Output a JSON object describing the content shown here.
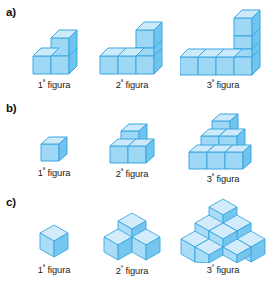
{
  "colors": {
    "cube_front": "#9ed8f5",
    "cube_top": "#cdeafb",
    "cube_side": "#6ec4ee",
    "cube_stroke": "#3ba7e0",
    "iso_top": "#d3ecfc",
    "iso_left": "#a9dcf7",
    "iso_right": "#74c6ef",
    "iso_stroke": "#3ba7e0",
    "text": "#1b1b1b",
    "background": "#ffffff"
  },
  "sections": [
    {
      "letter": "a)",
      "name": "section-a",
      "projection": "oblique",
      "figures": [
        {
          "label_number": "1",
          "label_ordinal": "ª",
          "label_word": "figura",
          "label_full": "1ª figura",
          "cube_count": 3,
          "description": "L-shape: 2 cubes in a row with 1 cube stacked on the right",
          "cells": [
            [
              0,
              0
            ],
            [
              1,
              0
            ],
            [
              1,
              1
            ]
          ]
        },
        {
          "label_number": "2",
          "label_ordinal": "ª",
          "label_word": "figura",
          "label_full": "2ª figura",
          "cube_count": 5,
          "description": "L-shape: 3 cubes in a row with 2 cubes stacked on the right",
          "cells": [
            [
              0,
              0
            ],
            [
              1,
              0
            ],
            [
              2,
              0
            ],
            [
              2,
              1
            ],
            [
              2,
              2
            ]
          ]
        },
        {
          "label_number": "3",
          "label_ordinal": "ª",
          "label_word": "figura",
          "label_full": "3ª figura",
          "cube_count": 7,
          "description": "L-shape: 4 cubes in a row with 3 cubes stacked on the right",
          "cells": [
            [
              0,
              0
            ],
            [
              1,
              0
            ],
            [
              2,
              0
            ],
            [
              3,
              0
            ],
            [
              3,
              1
            ],
            [
              3,
              2
            ],
            [
              3,
              3
            ]
          ]
        }
      ]
    },
    {
      "letter": "b)",
      "name": "section-b",
      "projection": "oblique",
      "figures": [
        {
          "label_number": "1",
          "label_ordinal": "ª",
          "label_word": "figura",
          "label_full": "1ª figura",
          "cube_count": 1,
          "description": "single cube",
          "rows": [
            1
          ]
        },
        {
          "label_number": "2",
          "label_ordinal": "ª",
          "label_word": "figura",
          "label_full": "2ª figura",
          "cube_count": 3,
          "description": "pyramid: 2 cubes base, 1 cube on top",
          "rows": [
            2,
            1
          ]
        },
        {
          "label_number": "3",
          "label_ordinal": "ª",
          "label_word": "figura",
          "label_full": "3ª figura",
          "cube_count": 6,
          "description": "pyramid: 3 cubes base, 2 middle, 1 top",
          "rows": [
            3,
            2,
            1
          ]
        }
      ]
    },
    {
      "letter": "c)",
      "name": "section-c",
      "projection": "isometric",
      "figures": [
        {
          "label_number": "1",
          "label_ordinal": "ª",
          "label_word": "figura",
          "label_full": "1ª figura",
          "cube_count": 1,
          "description": "single isometric cube"
        },
        {
          "label_number": "2",
          "label_ordinal": "º",
          "label_word": "figura",
          "label_full": "2º figura",
          "cube_count": 3,
          "description": "three isometric cubes: two at front, one behind on top"
        },
        {
          "label_number": "3",
          "label_ordinal": "º",
          "label_word": "figura",
          "label_full": "3º figura",
          "cube_count": 10,
          "description": "stepped isometric pyramid of ten cubes"
        }
      ]
    }
  ]
}
